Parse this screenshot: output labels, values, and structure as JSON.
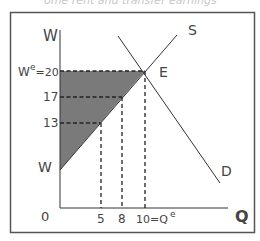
{
  "caption": "ome rent and transfer earnings",
  "diagram": {
    "y_axis_label": "W",
    "x_axis_label": "Q",
    "origin_label": "0",
    "supply_label": "S",
    "demand_label": "D",
    "equilibrium_label": "E",
    "wage_intercept_label": "W",
    "y_ticks": [
      {
        "label_main": "W",
        "label_sup": "e",
        "label_rest": "=20",
        "value": 20
      },
      {
        "label": "17",
        "value": 17
      },
      {
        "label": "13",
        "value": 13
      }
    ],
    "x_ticks": [
      {
        "label": "5",
        "value": 5
      },
      {
        "label": "8",
        "value": 8
      },
      {
        "label_main": "10=Q",
        "label_sup": "e",
        "value": 10
      }
    ],
    "shaded_region": "economic rent",
    "colors": {
      "shade": "#7a7a7a",
      "line": "#333333",
      "frame": "#555555"
    }
  }
}
